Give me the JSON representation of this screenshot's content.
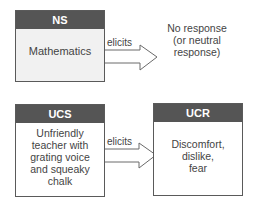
{
  "diagram": {
    "top_row": {
      "stimulus_box": {
        "title": "NS",
        "text": "Mathematics"
      },
      "arrow_label": "elicits",
      "response_text": [
        "No response",
        "(or neutral",
        "response)"
      ]
    },
    "bottom_row": {
      "stimulus_box": {
        "title": "UCS",
        "lines": [
          "Unfriendly",
          "teacher with",
          "grating voice",
          "and squeaky",
          "chalk"
        ]
      },
      "arrow_label": "elicits",
      "response_box": {
        "title": "UCR",
        "lines": [
          "Discomfort,",
          "dislike,",
          "fear"
        ]
      }
    }
  },
  "colors": {
    "header_bg": "#555555",
    "header_text": "#ffffff",
    "ns_body_bg": "#f1f1f1",
    "border": "#5a5a5a",
    "text": "#444444"
  }
}
